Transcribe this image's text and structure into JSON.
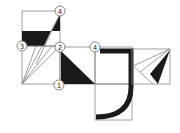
{
  "diagram": {
    "labels": [
      {
        "id": "label-4-top",
        "text": "4",
        "x": 60,
        "y": 11
      },
      {
        "id": "label-3",
        "text": "3",
        "x": 22,
        "y": 46
      },
      {
        "id": "label-2",
        "text": "2",
        "x": 60,
        "y": 47
      },
      {
        "id": "label-4-mid",
        "text": "4",
        "x": 95,
        "y": 47
      },
      {
        "id": "label-1",
        "text": "1",
        "x": 59,
        "y": 85
      }
    ],
    "colors": {
      "line": "#888888",
      "fill": "#1a1a1a",
      "background": "#ffffff"
    }
  }
}
